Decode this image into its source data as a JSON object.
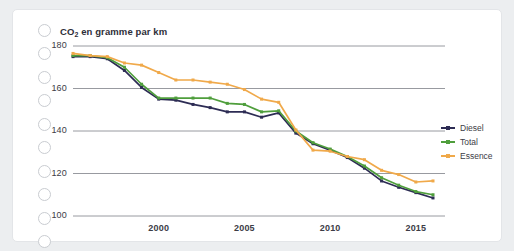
{
  "card": {
    "punch_hole_count": 10,
    "punch_hole_name": "punch-hole"
  },
  "chart_data": {
    "type": "line",
    "title": "CO2 en gramme par km",
    "title_prefix": "CO",
    "title_subscript": "2",
    "title_suffix": " en gramme par km",
    "xlabel": "",
    "ylabel": "",
    "grid": true,
    "legend_position": "right",
    "xlim": [
      1995,
      2016
    ],
    "ylim": [
      100,
      180
    ],
    "yticks": [
      180,
      160,
      140,
      120,
      100
    ],
    "xticks": [
      2000,
      2005,
      2010,
      2015
    ],
    "x": [
      1995,
      1996,
      1997,
      1998,
      1999,
      2000,
      2001,
      2002,
      2003,
      2004,
      2005,
      2006,
      2007,
      2008,
      2009,
      2010,
      2011,
      2012,
      2013,
      2014,
      2015,
      2016
    ],
    "series": [
      {
        "name": "Diesel",
        "color": "#2d2c54",
        "values": [
          175.0,
          175.0,
          174.0,
          168.5,
          160.5,
          155.0,
          154.5,
          152.5,
          151.0,
          149.0,
          149.0,
          146.5,
          148.5,
          139.0,
          134.0,
          131.0,
          127.5,
          122.5,
          116.5,
          113.5,
          111.0,
          108.5
        ]
      },
      {
        "name": "Total",
        "color": "#4f9e3c",
        "values": [
          175.5,
          175.5,
          174.5,
          170.0,
          162.0,
          155.5,
          155.5,
          155.5,
          155.5,
          153.0,
          152.5,
          149.0,
          149.5,
          140.0,
          134.5,
          131.5,
          128.0,
          123.5,
          118.0,
          114.5,
          111.5,
          110.0
        ]
      },
      {
        "name": "Essence",
        "color": "#f0a94a",
        "values": [
          176.5,
          175.5,
          175.0,
          172.0,
          171.0,
          167.5,
          164.0,
          164.0,
          163.0,
          162.0,
          159.5,
          155.0,
          153.5,
          140.5,
          131.0,
          130.5,
          128.0,
          126.5,
          121.5,
          119.5,
          116.0,
          116.5
        ]
      }
    ]
  }
}
